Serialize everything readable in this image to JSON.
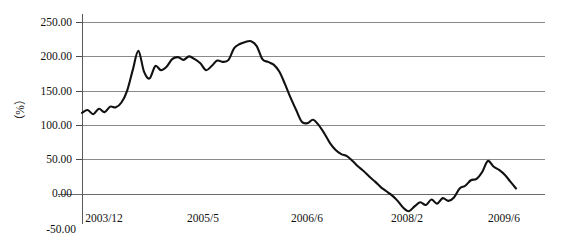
{
  "chart_data": {
    "type": "line",
    "title": "",
    "subtitle": "",
    "xlabel": "",
    "ylabel": "（%）",
    "ylim": [
      -50,
      250
    ],
    "xlim": [
      0,
      66
    ],
    "grid": true,
    "grid_axis": "y",
    "legend": false,
    "legend_position": "none",
    "line_color": "#111111",
    "grid_color": "#8a8a8a",
    "y_ticks": [
      250,
      200,
      150,
      100,
      50,
      0,
      -50
    ],
    "y_tick_labels": [
      "250.00",
      "200.00",
      "150.00",
      "100.00",
      "50.00",
      "0.00",
      "-50.00"
    ],
    "x_tick_positions": [
      0,
      17,
      30,
      50,
      66
    ],
    "x_tick_labels": [
      "2003/12",
      "2005/5",
      "2006/6",
      "2008/2",
      "2009/6"
    ],
    "series": [
      {
        "name": "growth-rate",
        "x": [
          0,
          1,
          2,
          3,
          4,
          5,
          6,
          7,
          8,
          9,
          10,
          11,
          12,
          13,
          14,
          15,
          16,
          17,
          18,
          19,
          20,
          21,
          22,
          23,
          24,
          25,
          26,
          27,
          28,
          29,
          30,
          31,
          32,
          33,
          34,
          35,
          36,
          37,
          38,
          39,
          40,
          41,
          42,
          43,
          44,
          45,
          46,
          47,
          48,
          49,
          50,
          51,
          52,
          53,
          54,
          55,
          56,
          57,
          58,
          59,
          60,
          61,
          62,
          63,
          64,
          65,
          66
        ],
        "values": [
          118,
          122,
          116,
          124,
          119,
          127,
          126,
          133,
          150,
          180,
          208,
          178,
          168,
          186,
          180,
          185,
          196,
          199,
          195,
          200,
          196,
          190,
          180,
          186,
          194,
          192,
          195,
          212,
          218,
          221,
          222,
          215,
          196,
          192,
          188,
          178,
          160,
          140,
          122,
          105,
          103,
          108,
          100,
          88,
          74,
          64,
          58,
          55,
          48,
          40,
          33,
          25,
          18,
          10,
          4,
          -2,
          -10,
          -20,
          -25,
          -18,
          -12,
          -16,
          -8,
          -14,
          -6,
          -10,
          -5
        ],
        "annotations": [
          {
            "label": "peak",
            "x": 30,
            "value": 222
          },
          {
            "label": "trough",
            "x": 58,
            "value": -25
          }
        ]
      }
    ],
    "tail": {
      "x": [
        66,
        67,
        68,
        69,
        70,
        71,
        72,
        73,
        74,
        75,
        76,
        77
      ],
      "values": [
        -5,
        8,
        12,
        20,
        22,
        32,
        48,
        40,
        35,
        28,
        18,
        8
      ]
    }
  }
}
